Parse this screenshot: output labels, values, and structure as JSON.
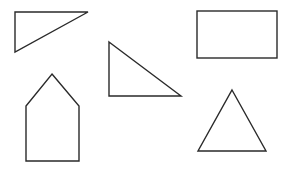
{
  "diagram": {
    "title": "",
    "background": "#ffffff",
    "stroke_color": "#2a2a2a",
    "shapes": [
      {
        "id": "shape-right-triangle-top-left",
        "kind": "right-triangle",
        "label": ""
      },
      {
        "id": "shape-right-triangle-middle",
        "kind": "right-triangle",
        "label": ""
      },
      {
        "id": "shape-rectangle",
        "kind": "rectangle",
        "label": ""
      },
      {
        "id": "shape-pentagon-house",
        "kind": "pentagon",
        "label": ""
      },
      {
        "id": "shape-triangle",
        "kind": "triangle",
        "label": ""
      }
    ]
  }
}
